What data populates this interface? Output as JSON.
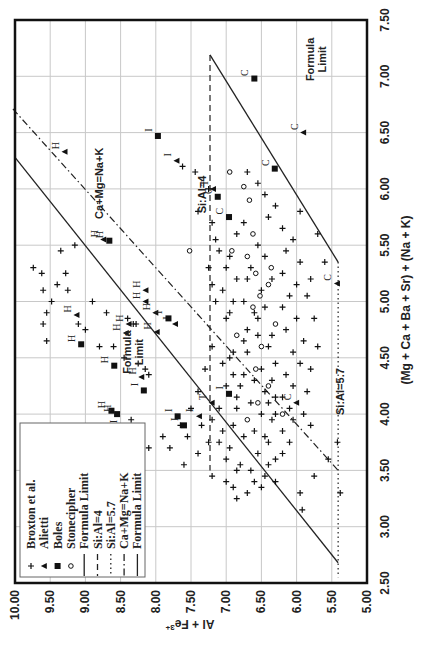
{
  "chart_data": {
    "type": "scatter",
    "orientation_note": "figure rotated 90 degrees counter-clockwise",
    "xlabel": "(Mg + Ca + Ba + Sr) + (Na + K)",
    "ylabel": "Al + Fe3+",
    "ylabel_main": "Al + Fe",
    "ylabel_sup": "3+",
    "xlim": [
      2.5,
      7.5
    ],
    "ylim": [
      5.0,
      10.0
    ],
    "x_ticks": [
      "2.50",
      "3.00",
      "3.50",
      "4.00",
      "4.50",
      "5.00",
      "5.50",
      "6.00",
      "6.50",
      "7.00",
      "7.50"
    ],
    "y_ticks": [
      "10.00",
      "9.50",
      "9.00",
      "8.50",
      "8.00",
      "7.50",
      "7.00",
      "6.50",
      "6.00",
      "5.50",
      "5.00"
    ],
    "grid": true,
    "legend": {
      "position": "lower-left (rotated)",
      "entries": [
        {
          "label": "Broxton et al.",
          "marker": "plus"
        },
        {
          "label": "Alietti",
          "marker": "triangle"
        },
        {
          "label": "Boles",
          "marker": "square"
        },
        {
          "label": "Stonecipher",
          "marker": "circle"
        },
        {
          "label": "Formula Limit",
          "line": "solid"
        },
        {
          "label": "Si:Al=4",
          "line": "dashed"
        },
        {
          "label": "Si:Al=5.7",
          "line": "dotted"
        },
        {
          "label": "Ca+Mg=Na+K",
          "line": "dashdot"
        },
        {
          "label": "Formula Limit",
          "line": "solid"
        }
      ]
    },
    "annotations": [
      {
        "text": "Formula Limit",
        "x": 7.15,
        "y": 5.75,
        "lines": [
          "Formula",
          "Limit"
        ]
      },
      {
        "text": "Formula Limit",
        "x": 4.55,
        "y": 8.35,
        "lines": [
          "Formula",
          "Limit"
        ]
      },
      {
        "text": "Ca+Mg=Na+K",
        "x": 6.05,
        "y": 8.75
      },
      {
        "text": "Si:Al=4",
        "x": 5.95,
        "y": 7.28
      },
      {
        "text": "Si:Al=5.7",
        "x": 4.2,
        "y": 5.33
      }
    ],
    "lines": [
      {
        "name": "Formula Limit (upper)",
        "style": "solid",
        "points": [
          [
            7.19,
            7.23
          ],
          [
            5.35,
            5.41
          ]
        ]
      },
      {
        "name": "Formula Limit (lower)",
        "style": "solid",
        "points": [
          [
            6.28,
            10.0
          ],
          [
            2.68,
            5.41
          ]
        ]
      },
      {
        "name": "Si:Al=4",
        "style": "dashed",
        "points": [
          [
            7.19,
            7.23
          ],
          [
            3.5,
            7.23
          ]
        ]
      },
      {
        "name": "Si:Al=5.7",
        "style": "dotted",
        "points": [
          [
            5.35,
            5.41
          ],
          [
            2.55,
            5.41
          ]
        ]
      },
      {
        "name": "Ca+Mg=Na+K",
        "style": "dashdot",
        "points": [
          [
            6.71,
            10.03
          ],
          [
            3.5,
            5.41
          ]
        ]
      }
    ],
    "series": [
      {
        "name": "Alietti",
        "marker": "triangle",
        "points": [
          [
            6.33,
            9.29,
            "H"
          ],
          [
            6.25,
            7.7,
            "I"
          ],
          [
            5.55,
            8.74,
            "H"
          ],
          [
            5.1,
            8.14,
            "H"
          ],
          [
            5.0,
            8.14,
            "H"
          ],
          [
            4.9,
            8.0,
            "H"
          ],
          [
            4.8,
            8.38,
            "H"
          ],
          [
            4.72,
            8.42,
            "H"
          ],
          [
            4.8,
            7.72,
            "I"
          ],
          [
            4.88,
            9.12,
            "H"
          ],
          [
            4.73,
            7.98,
            "H"
          ],
          [
            4.33,
            8.2,
            "H"
          ],
          [
            3.98,
            7.38,
            "I"
          ],
          [
            4.1,
            7.2,
            "T"
          ],
          [
            6.0,
            7.18,
            "T"
          ],
          [
            6.5,
            5.9,
            "C"
          ],
          [
            5.16,
            5.42,
            "C"
          ],
          [
            4.1,
            6.0,
            "C"
          ]
        ]
      },
      {
        "name": "Boles",
        "marker": "square",
        "points": [
          [
            6.98,
            6.6,
            "C"
          ],
          [
            6.47,
            7.97,
            "I"
          ],
          [
            5.54,
            8.66,
            "H"
          ],
          [
            4.62,
            9.06,
            "H"
          ],
          [
            4.85,
            7.82,
            "I"
          ],
          [
            4.43,
            8.59,
            "H"
          ],
          [
            4.21,
            8.17,
            "I"
          ],
          [
            4.03,
            8.63,
            "H"
          ],
          [
            3.88,
            8.46,
            "I"
          ],
          [
            3.98,
            7.69,
            "I"
          ],
          [
            4.0,
            8.55,
            "H"
          ],
          [
            6.18,
            6.31,
            "C"
          ],
          [
            5.75,
            6.96,
            "C"
          ],
          [
            5.93,
            7.12,
            "C"
          ],
          [
            4.18,
            6.96,
            "I"
          ],
          [
            3.9,
            7.6,
            "I"
          ]
        ]
      },
      {
        "name": "Stonecipher",
        "marker": "circle",
        "points": [
          [
            6.15,
            6.95
          ],
          [
            5.9,
            6.67
          ],
          [
            5.45,
            6.92
          ],
          [
            5.45,
            7.52
          ],
          [
            5.4,
            6.7
          ],
          [
            5.25,
            6.58
          ],
          [
            5.15,
            6.4
          ],
          [
            5.05,
            6.52
          ],
          [
            4.95,
            6.62
          ],
          [
            4.8,
            6.3
          ],
          [
            4.7,
            6.85
          ],
          [
            4.6,
            6.5
          ],
          [
            4.4,
            6.58
          ],
          [
            4.1,
            6.55
          ],
          [
            4.0,
            6.2
          ],
          [
            3.95,
            6.7
          ],
          [
            4.25,
            6.4
          ],
          [
            5.3,
            6.36
          ],
          [
            5.6,
            6.62
          ],
          [
            6.02,
            6.75
          ]
        ]
      },
      {
        "name": "Broxton et al.",
        "marker": "plus",
        "points": [
          [
            5.3,
            9.74
          ],
          [
            5.25,
            9.62
          ],
          [
            5.1,
            9.6
          ],
          [
            5.0,
            9.48
          ],
          [
            4.9,
            9.55
          ],
          [
            4.8,
            9.6
          ],
          [
            4.65,
            9.55
          ],
          [
            5.15,
            9.4
          ],
          [
            5.1,
            9.25
          ],
          [
            5.25,
            9.28
          ],
          [
            5.45,
            9.35
          ],
          [
            5.5,
            9.15
          ],
          [
            4.8,
            9.1
          ],
          [
            4.75,
            9.0
          ],
          [
            4.9,
            8.7
          ],
          [
            5.0,
            8.9
          ],
          [
            4.6,
            8.8
          ],
          [
            4.6,
            8.6
          ],
          [
            4.5,
            8.45
          ],
          [
            4.45,
            8.25
          ],
          [
            4.4,
            8.15
          ],
          [
            4.35,
            8.1
          ],
          [
            4.8,
            8.28
          ],
          [
            4.8,
            8.32
          ],
          [
            4.85,
            8.4
          ],
          [
            6.2,
            7.62
          ],
          [
            6.15,
            7.44
          ],
          [
            6.0,
            7.25
          ],
          [
            5.8,
            7.4
          ],
          [
            5.7,
            7.2
          ],
          [
            5.55,
            7.15
          ],
          [
            5.45,
            7.1
          ],
          [
            5.4,
            6.95
          ],
          [
            5.3,
            7.0
          ],
          [
            5.2,
            6.85
          ],
          [
            5.2,
            6.7
          ],
          [
            5.1,
            7.05
          ],
          [
            5.0,
            6.9
          ],
          [
            5.0,
            6.75
          ],
          [
            4.9,
            6.6
          ],
          [
            4.85,
            7.0
          ],
          [
            4.75,
            6.7
          ],
          [
            4.7,
            6.55
          ],
          [
            4.6,
            6.4
          ],
          [
            4.55,
            6.7
          ],
          [
            4.5,
            6.95
          ],
          [
            4.45,
            6.3
          ],
          [
            4.4,
            6.5
          ],
          [
            4.35,
            6.75
          ],
          [
            4.3,
            6.6
          ],
          [
            4.25,
            6.8
          ],
          [
            4.2,
            6.45
          ],
          [
            4.15,
            6.2
          ],
          [
            4.1,
            6.65
          ],
          [
            4.05,
            6.85
          ],
          [
            4.0,
            6.5
          ],
          [
            3.95,
            6.35
          ],
          [
            3.9,
            6.9
          ],
          [
            3.85,
            6.6
          ],
          [
            3.8,
            6.75
          ],
          [
            3.75,
            6.4
          ],
          [
            3.7,
            6.95
          ],
          [
            3.65,
            6.55
          ],
          [
            3.6,
            6.3
          ],
          [
            3.55,
            6.8
          ],
          [
            3.5,
            6.65
          ],
          [
            3.45,
            6.45
          ],
          [
            3.4,
            6.6
          ],
          [
            3.35,
            6.5
          ],
          [
            3.3,
            6.7
          ],
          [
            3.85,
            6.2
          ],
          [
            3.95,
            6.05
          ],
          [
            4.05,
            6.1
          ],
          [
            4.15,
            6.3
          ],
          [
            4.25,
            6.05
          ],
          [
            4.35,
            6.15
          ],
          [
            4.45,
            5.95
          ],
          [
            4.55,
            6.05
          ],
          [
            4.65,
            5.9
          ],
          [
            4.75,
            6.15
          ],
          [
            4.85,
            6.0
          ],
          [
            4.95,
            6.2
          ],
          [
            5.05,
            6.1
          ],
          [
            5.15,
            6.0
          ],
          [
            5.25,
            6.2
          ],
          [
            5.35,
            5.95
          ],
          [
            5.45,
            6.15
          ],
          [
            5.55,
            6.05
          ],
          [
            5.65,
            6.2
          ],
          [
            5.75,
            6.4
          ],
          [
            5.85,
            6.3
          ],
          [
            5.95,
            6.45
          ],
          [
            6.05,
            6.55
          ],
          [
            6.15,
            6.7
          ],
          [
            5.6,
            6.85
          ],
          [
            5.7,
            6.75
          ],
          [
            5.5,
            6.55
          ],
          [
            5.4,
            6.45
          ],
          [
            5.3,
            6.65
          ],
          [
            5.2,
            6.35
          ],
          [
            5.1,
            6.5
          ],
          [
            4.95,
            6.45
          ],
          [
            4.85,
            6.55
          ],
          [
            4.65,
            6.75
          ],
          [
            4.55,
            6.9
          ],
          [
            4.45,
            7.05
          ],
          [
            4.35,
            6.9
          ],
          [
            4.25,
            7.0
          ],
          [
            4.15,
            6.85
          ],
          [
            4.05,
            7.1
          ],
          [
            3.95,
            7.2
          ],
          [
            3.85,
            7.05
          ],
          [
            3.75,
            7.25
          ],
          [
            3.65,
            7.4
          ],
          [
            3.55,
            7.6
          ],
          [
            3.7,
            7.8
          ],
          [
            3.8,
            7.55
          ],
          [
            3.9,
            7.35
          ],
          [
            3.75,
            7.1
          ],
          [
            3.6,
            7.0
          ],
          [
            3.5,
            6.85
          ],
          [
            3.45,
            7.2
          ],
          [
            3.4,
            7.0
          ],
          [
            3.35,
            6.9
          ],
          [
            3.25,
            6.85
          ],
          [
            3.4,
            6.3
          ],
          [
            3.55,
            6.4
          ],
          [
            3.65,
            6.2
          ],
          [
            3.75,
            6.1
          ],
          [
            3.3,
            5.95
          ],
          [
            3.45,
            5.75
          ],
          [
            3.15,
            5.92
          ],
          [
            3.9,
            5.8
          ],
          [
            4.0,
            5.9
          ],
          [
            4.2,
            5.85
          ],
          [
            4.4,
            5.8
          ],
          [
            4.6,
            5.7
          ],
          [
            3.6,
            5.55
          ],
          [
            3.75,
            5.42
          ],
          [
            3.3,
            5.38
          ],
          [
            5.8,
            5.95
          ],
          [
            5.6,
            5.7
          ],
          [
            5.35,
            5.6
          ],
          [
            5.05,
            5.85
          ],
          [
            4.85,
            5.75
          ],
          [
            5.2,
            5.8
          ],
          [
            4.7,
            6.35
          ],
          [
            4.3,
            6.35
          ],
          [
            4.0,
            6.3
          ],
          [
            3.8,
            6.45
          ],
          [
            4.1,
            6.4
          ],
          [
            4.9,
            6.95
          ],
          [
            5.0,
            7.15
          ],
          [
            5.15,
            7.2
          ],
          [
            5.3,
            7.25
          ],
          [
            4.6,
            7.2
          ],
          [
            4.4,
            7.3
          ],
          [
            4.2,
            7.4
          ],
          [
            4.05,
            7.5
          ],
          [
            3.9,
            7.65
          ],
          [
            3.8,
            7.9
          ],
          [
            3.7,
            8.1
          ],
          [
            3.65,
            8.35
          ],
          [
            3.55,
            8.5
          ],
          [
            3.75,
            8.6
          ],
          [
            3.85,
            8.85
          ],
          [
            3.95,
            8.35
          ]
        ]
      }
    ]
  }
}
